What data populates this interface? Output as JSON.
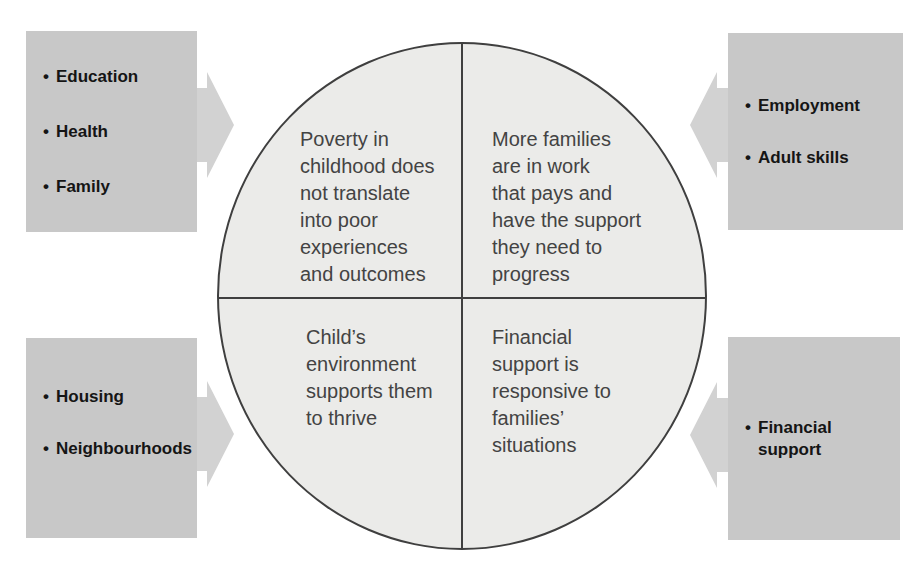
{
  "diagram": {
    "bullet_glyph": "•",
    "colors": {
      "box_fill": "#c8c8c8",
      "arrow_fill": "#d2d2d2",
      "circle_fill": "#ebebe9",
      "divider": "#3f3f3f",
      "box_text": "#151515",
      "circle_text": "#434343",
      "background": "#ffffff"
    },
    "boxes": {
      "top_left": {
        "arrow_direction": "right",
        "items": [
          "Education",
          "Health",
          "Family"
        ]
      },
      "bottom_left": {
        "arrow_direction": "right",
        "items": [
          "Housing",
          "Neighbourhoods"
        ]
      },
      "top_right": {
        "arrow_direction": "left",
        "items": [
          "Employment",
          "Adult skills"
        ]
      },
      "bottom_right": {
        "arrow_direction": "left",
        "items": [
          "Financial support"
        ]
      }
    },
    "circle": {
      "quadrants": {
        "top_left": {
          "lines": [
            "Poverty in",
            "childhood does",
            "not translate",
            "into poor",
            "experiences",
            "and outcomes"
          ]
        },
        "top_right": {
          "lines": [
            "More families",
            "are in work",
            "that pays and",
            "have the support",
            "they need to",
            "progress"
          ]
        },
        "bottom_left": {
          "lines": [
            "Child’s",
            "environment",
            "supports them",
            "to thrive"
          ]
        },
        "bottom_right": {
          "lines": [
            "Financial",
            "support is",
            "responsive to",
            "families’",
            "situations"
          ]
        }
      }
    }
  }
}
